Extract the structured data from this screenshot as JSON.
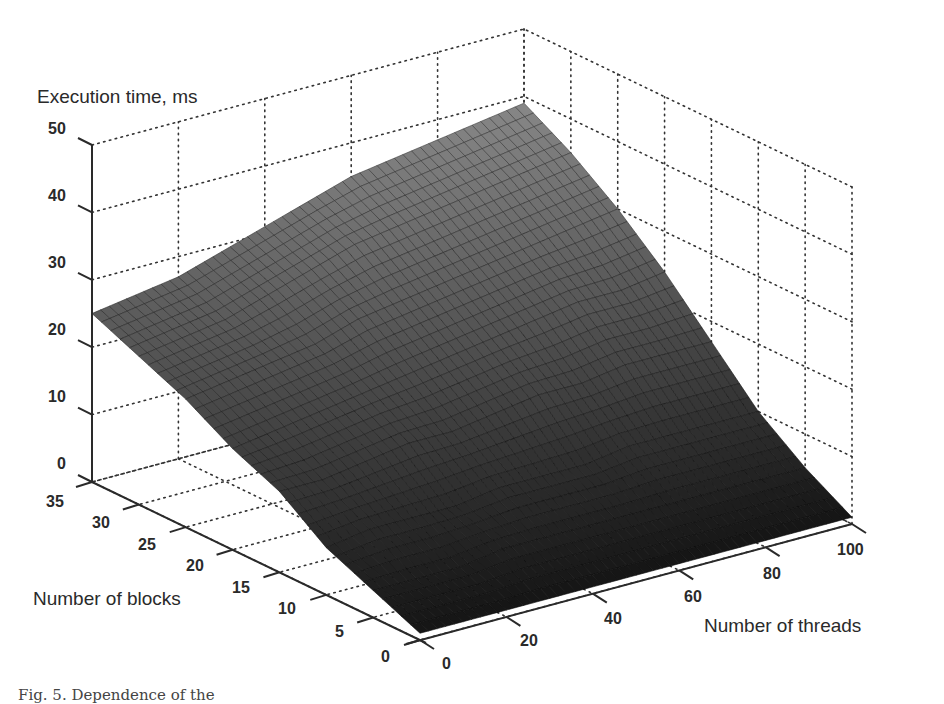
{
  "chart_data": {
    "type": "surface3d",
    "title": "",
    "zlabel": "Execution time, ms",
    "xlabel": "Number of threads",
    "ylabel": "Number of blocks",
    "x_ticks": [
      0,
      20,
      40,
      60,
      80,
      100
    ],
    "y_ticks": [
      0,
      5,
      10,
      15,
      20,
      25,
      30,
      35
    ],
    "z_ticks": [
      0,
      10,
      20,
      30,
      40,
      50
    ],
    "xlim": [
      0,
      100
    ],
    "ylim": [
      0,
      35
    ],
    "zlim": [
      0,
      50
    ],
    "grid": "dotted",
    "x_samples": [
      0,
      10,
      20,
      30,
      40,
      50,
      60,
      70,
      80,
      90,
      100
    ],
    "y_samples": [
      0,
      5,
      10,
      15,
      20,
      25,
      30,
      35
    ],
    "z_values_by_block": [
      [
        1,
        1,
        1,
        1,
        1,
        1,
        1,
        1,
        1,
        1,
        1
      ],
      [
        4,
        4,
        4,
        5,
        5,
        5,
        5,
        5,
        5,
        5,
        5
      ],
      [
        7,
        8,
        8,
        8,
        9,
        9,
        9,
        10,
        10,
        10,
        10
      ],
      [
        12,
        12,
        13,
        14,
        14,
        15,
        16,
        16,
        17,
        17,
        17
      ],
      [
        15,
        16,
        17,
        18,
        19,
        20,
        21,
        22,
        23,
        23,
        24
      ],
      [
        19,
        20,
        21,
        22,
        24,
        25,
        26,
        27,
        28,
        29,
        30
      ],
      [
        22,
        23,
        24,
        26,
        28,
        30,
        31,
        32,
        33,
        34,
        35
      ],
      [
        25,
        26,
        27,
        29,
        31,
        33,
        35,
        36,
        37,
        38,
        39
      ]
    ],
    "colormap": "gray"
  },
  "labels": {
    "z_axis_title": "Execution time, ms",
    "y_axis_title": "Number of blocks",
    "x_axis_title": "Number of threads",
    "z_tick_labels": [
      "0",
      "10",
      "20",
      "30",
      "40",
      "50"
    ],
    "y_tick_labels": [
      "0",
      "5",
      "10",
      "15",
      "20",
      "25",
      "30",
      "35"
    ],
    "x_tick_labels": [
      "0",
      "20",
      "40",
      "60",
      "80",
      "100"
    ]
  },
  "caption": "Fig. 5. Dependence of the"
}
